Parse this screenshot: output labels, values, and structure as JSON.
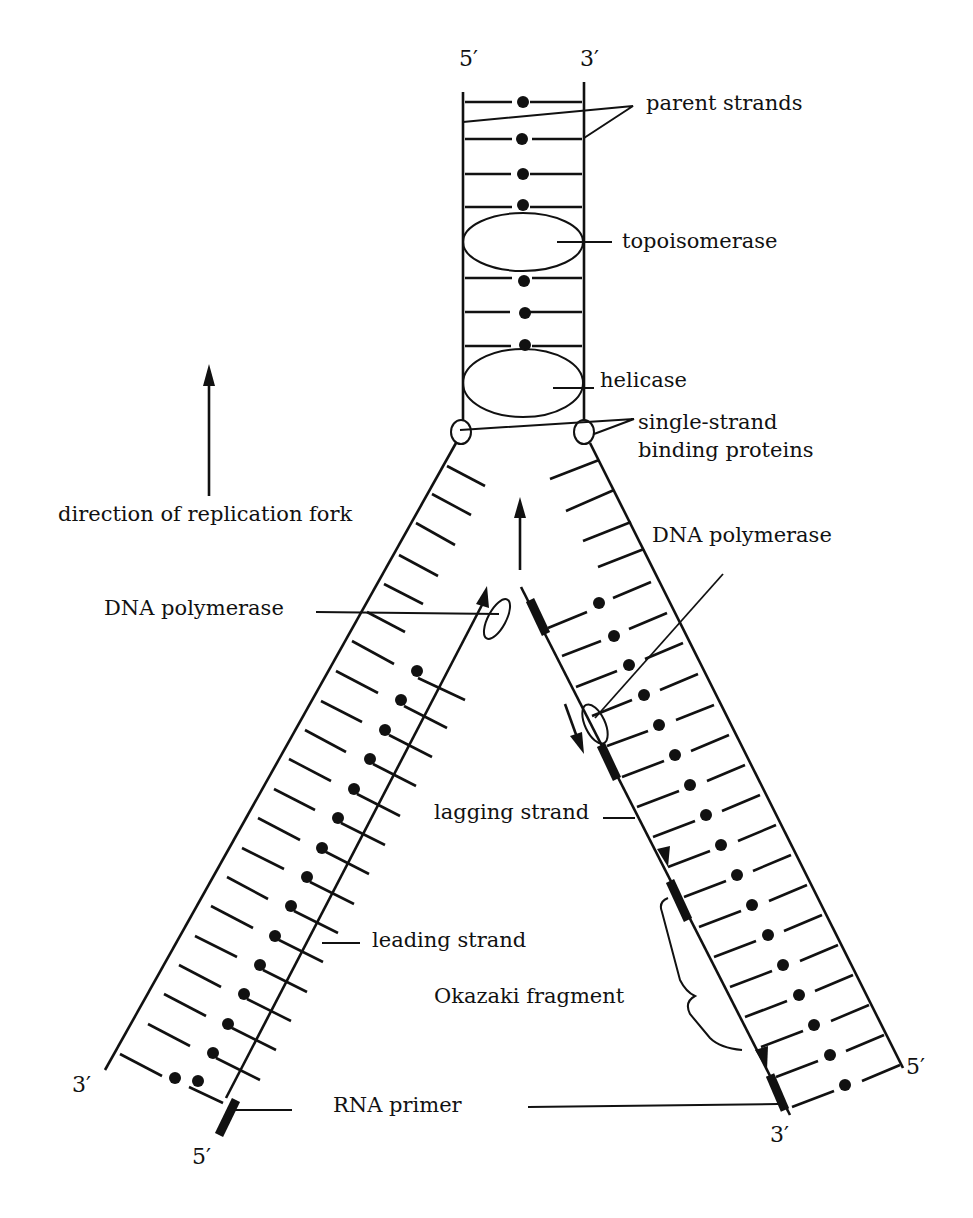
{
  "diagram": {
    "type": "DNA replication fork",
    "ends": {
      "parent_top_left": "5′",
      "parent_top_right": "3′",
      "left_arm_bottom_outer": "3′",
      "left_arm_bottom_inner": "5′",
      "right_arm_bottom_outer": "5′",
      "right_arm_bottom_inner": "3′"
    },
    "labels": {
      "parent_strands": "parent strands",
      "topoisomerase": "topoisomerase",
      "helicase": "helicase",
      "ssb_line1": "single-strand",
      "ssb_line2": "binding proteins",
      "direction": "direction of replication fork",
      "dna_polymerase_left": "DNA polymerase",
      "dna_polymerase_right": "DNA polymerase",
      "lagging_strand": "lagging strand",
      "leading_strand": "leading strand",
      "okazaki_fragment": "Okazaki fragment",
      "rna_primer": "RNA primer"
    },
    "colors": {
      "ink": "#111111",
      "background": "#ffffff"
    }
  }
}
